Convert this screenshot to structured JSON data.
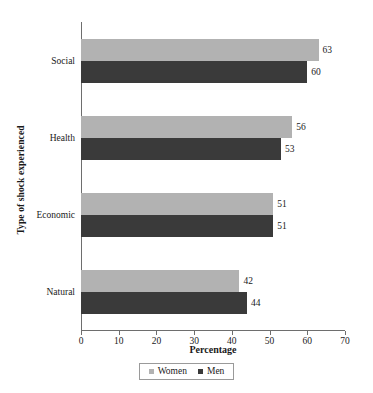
{
  "chart_data": {
    "type": "bar",
    "orientation": "horizontal",
    "title": "",
    "xlabel": "Percentage",
    "ylabel": "Type of shock experienced",
    "categories": [
      "Natural",
      "Economic",
      "Health",
      "Social"
    ],
    "series": [
      {
        "name": "Women",
        "values": [
          42,
          51,
          56,
          63
        ],
        "color": "#b2b2b2"
      },
      {
        "name": "Men",
        "values": [
          44,
          51,
          53,
          60
        ],
        "color": "#3a3a3a"
      }
    ],
    "xlim": [
      0,
      70
    ],
    "xticks": [
      0,
      10,
      20,
      30,
      40,
      50,
      60,
      70
    ],
    "xtick_labels": [
      "0",
      "10",
      "20",
      "30",
      "40",
      "50",
      "60",
      "70"
    ],
    "grid": false,
    "legend_position": "bottom",
    "data_labels": true
  },
  "axes": {
    "x_title": "Percentage",
    "y_title": "Type of shock experienced"
  },
  "legend": {
    "items": [
      {
        "label": "Women",
        "color": "#b2b2b2"
      },
      {
        "label": "Men",
        "color": "#3a3a3a"
      }
    ]
  }
}
